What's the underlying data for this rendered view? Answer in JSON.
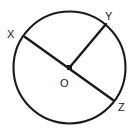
{
  "figure": {
    "name": "circle-with-radii",
    "background_color": "#ffffff",
    "stroke_color": "#1a1a1a",
    "label_color": "#1a1a1a"
  },
  "circle": {
    "center_x": 69.5,
    "center_y": 67.5,
    "radius": 56,
    "stroke_width": 2.1
  },
  "center_point": {
    "label": "O",
    "x": 69.5,
    "y": 67.5,
    "label_x": 60,
    "label_y": 87,
    "marker_size": 5
  },
  "points": [
    {
      "label": "X",
      "x": 25,
      "y": 37,
      "label_x": 7,
      "label_y": 38
    },
    {
      "label": "Y",
      "x": 106,
      "y": 24,
      "label_x": 105,
      "label_y": 20
    },
    {
      "label": "Z",
      "x": 113,
      "y": 100,
      "label_x": 118,
      "label_y": 111
    }
  ],
  "segments": [
    {
      "name": "diameter-x-z",
      "from": "X",
      "to": "Z",
      "x1": 25,
      "y1": 37,
      "x2": 113,
      "y2": 100,
      "stroke_width": 2.4
    },
    {
      "name": "radius-o-y",
      "from": "O",
      "to": "Y",
      "x1": 69.5,
      "y1": 67.5,
      "x2": 106,
      "y2": 24,
      "stroke_width": 2.4
    }
  ]
}
